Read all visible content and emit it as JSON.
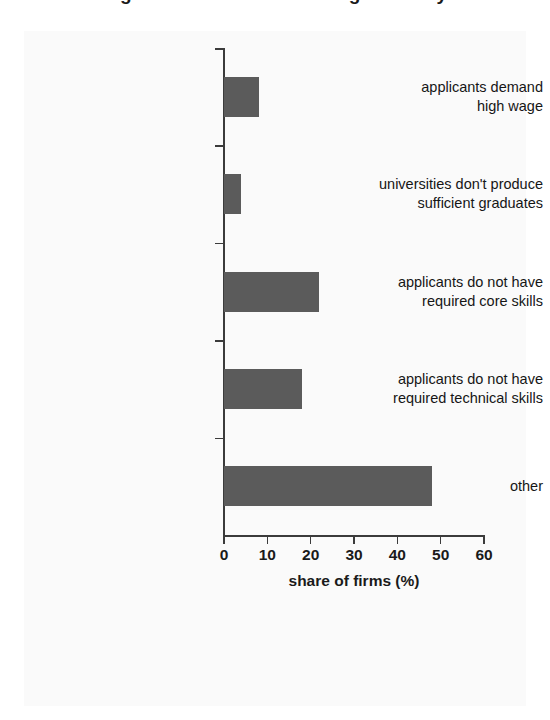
{
  "figure": {
    "cut_off_title": "Figure 4. Reasons for hiring difficulty"
  },
  "chart_data": {
    "type": "bar",
    "orientation": "horizontal",
    "title": "",
    "xlabel": "share of firms (%)",
    "ylabel": "",
    "xlim": [
      0,
      60
    ],
    "xticks": [
      0,
      10,
      20,
      30,
      40,
      50,
      60
    ],
    "xtick_labels": [
      "0",
      "10",
      "20",
      "30",
      "40",
      "50",
      "60"
    ],
    "grid": false,
    "legend": null,
    "bar_color": "#5b5b5b",
    "axis_color": "#3b3b3b",
    "background_color": "#fafafa",
    "categories": [
      "applicants demand high wage",
      "universities don't produce sufficient graduates",
      "applicants do not have required core skills",
      "applicants do not have required technical skills",
      "other"
    ],
    "category_label_lines": [
      [
        "applicants demand",
        "high wage"
      ],
      [
        "universities don't produce",
        "sufficient graduates"
      ],
      [
        "applicants do not have",
        "required core skills"
      ],
      [
        "applicants do not have",
        "required technical skills"
      ],
      [
        "other"
      ]
    ],
    "values": [
      8,
      4,
      22,
      18,
      48
    ]
  }
}
